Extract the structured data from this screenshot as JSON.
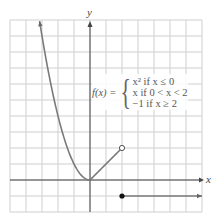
{
  "chart_data": {
    "type": "line",
    "title": "",
    "xlabel": "x",
    "ylabel": "y",
    "xlim": [
      -5,
      7
    ],
    "ylim": [
      -2,
      10
    ],
    "grid": true,
    "function_label": "f(x) =",
    "cases": [
      "x² if x ≤ 0",
      "x if 0 < x < 2",
      "−1 if x ≥ 2"
    ],
    "pieces": [
      {
        "name": "x-squared",
        "expr": "x^2",
        "domain": [
          -3.15,
          0
        ],
        "start_arrow": true
      },
      {
        "name": "identity",
        "expr": "x",
        "domain": [
          0,
          2
        ],
        "end": "open"
      },
      {
        "name": "constant",
        "expr": "-1",
        "domain": [
          2,
          7
        ],
        "start": "closed",
        "end_arrow": true
      }
    ],
    "points": [
      {
        "x": 2,
        "y": 2,
        "type": "open"
      },
      {
        "x": 2,
        "y": -1,
        "type": "closed"
      }
    ]
  }
}
